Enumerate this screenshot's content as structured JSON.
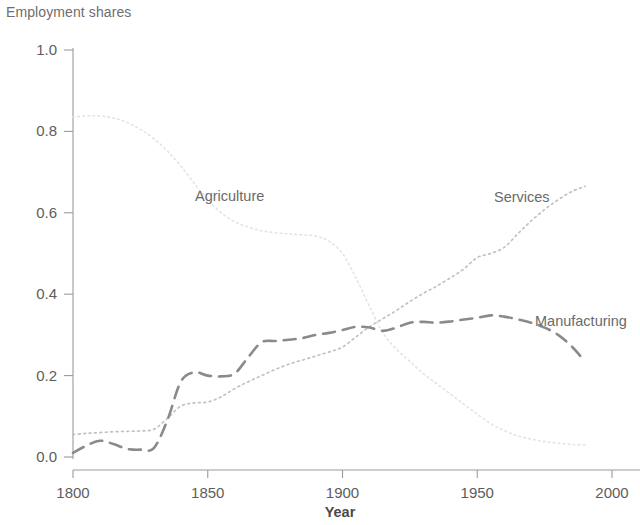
{
  "chart_title": "Employment shares",
  "axes": {
    "x": {
      "title": "Year",
      "ticks": [
        1800,
        1850,
        1900,
        1950,
        2000
      ],
      "tick_labels": [
        "1800",
        "1850",
        "1900",
        "1950",
        "2000"
      ],
      "min": 1795,
      "max": 2005
    },
    "y": {
      "title": "",
      "ticks": [
        0.0,
        0.2,
        0.4,
        0.6,
        0.8,
        1.0
      ],
      "tick_labels": [
        "0.0",
        "0.2",
        "0.4",
        "0.6",
        "0.8",
        "1.0"
      ],
      "min": 0.0,
      "max": 1.0
    }
  },
  "labels": {
    "agriculture": "Agriculture",
    "services": "Services",
    "manufacturing": "Manufacturing"
  },
  "colors": {
    "agriculture": "#e3e3e3",
    "services": "#c2c2c2",
    "manufacturing": "#8a8a8a",
    "axis": "#9b9b9b",
    "text": "#5d5d5d"
  },
  "chart_data": {
    "type": "line",
    "title": "Employment shares",
    "xlabel": "Year",
    "ylabel": "Employment shares",
    "xlim": [
      1795,
      2005
    ],
    "ylim": [
      0.0,
      1.0
    ],
    "grid": false,
    "legend_position": "inline-labels",
    "x_ticks": [
      1800,
      1850,
      1900,
      1950,
      2000
    ],
    "y_ticks": [
      0.0,
      0.2,
      0.4,
      0.6,
      0.8,
      1.0
    ],
    "series": [
      {
        "name": "Agriculture",
        "line_style": "dotted-fine",
        "color": "#e3e3e3",
        "x": [
          1800,
          1805,
          1810,
          1815,
          1820,
          1825,
          1830,
          1835,
          1840,
          1845,
          1850,
          1855,
          1860,
          1865,
          1870,
          1875,
          1880,
          1885,
          1890,
          1895,
          1900,
          1905,
          1910,
          1915,
          1920,
          1925,
          1930,
          1935,
          1940,
          1945,
          1950,
          1955,
          1960,
          1965,
          1970,
          1975,
          1980,
          1985,
          1990
        ],
        "y": [
          0.835,
          0.838,
          0.838,
          0.833,
          0.822,
          0.805,
          0.782,
          0.752,
          0.715,
          0.672,
          0.632,
          0.6,
          0.578,
          0.565,
          0.556,
          0.551,
          0.548,
          0.546,
          0.543,
          0.53,
          0.5,
          0.44,
          0.37,
          0.305,
          0.265,
          0.235,
          0.205,
          0.18,
          0.155,
          0.13,
          0.105,
          0.082,
          0.065,
          0.052,
          0.044,
          0.038,
          0.034,
          0.031,
          0.03
        ]
      },
      {
        "name": "Services",
        "line_style": "dotted",
        "color": "#c2c2c2",
        "x": [
          1800,
          1805,
          1810,
          1815,
          1820,
          1825,
          1830,
          1835,
          1840,
          1845,
          1850,
          1855,
          1860,
          1865,
          1870,
          1875,
          1880,
          1885,
          1890,
          1895,
          1900,
          1905,
          1910,
          1915,
          1920,
          1925,
          1930,
          1935,
          1940,
          1945,
          1950,
          1955,
          1960,
          1965,
          1970,
          1975,
          1980,
          1985,
          1990
        ],
        "y": [
          0.055,
          0.058,
          0.06,
          0.062,
          0.063,
          0.064,
          0.068,
          0.095,
          0.125,
          0.133,
          0.135,
          0.148,
          0.168,
          0.185,
          0.2,
          0.215,
          0.228,
          0.238,
          0.248,
          0.258,
          0.27,
          0.295,
          0.32,
          0.34,
          0.36,
          0.382,
          0.402,
          0.42,
          0.44,
          0.462,
          0.49,
          0.5,
          0.515,
          0.548,
          0.58,
          0.608,
          0.632,
          0.652,
          0.665
        ]
      },
      {
        "name": "Manufacturing",
        "line_style": "dashed",
        "color": "#8a8a8a",
        "x": [
          1800,
          1805,
          1810,
          1815,
          1820,
          1825,
          1830,
          1835,
          1840,
          1845,
          1850,
          1855,
          1860,
          1865,
          1870,
          1875,
          1880,
          1885,
          1890,
          1895,
          1900,
          1905,
          1910,
          1915,
          1920,
          1925,
          1930,
          1935,
          1940,
          1945,
          1950,
          1955,
          1960,
          1965,
          1970,
          1975,
          1980,
          1985,
          1990
        ],
        "y": [
          0.01,
          0.028,
          0.04,
          0.032,
          0.02,
          0.018,
          0.022,
          0.09,
          0.185,
          0.208,
          0.2,
          0.198,
          0.205,
          0.245,
          0.282,
          0.285,
          0.288,
          0.292,
          0.3,
          0.305,
          0.312,
          0.32,
          0.318,
          0.31,
          0.318,
          0.33,
          0.332,
          0.33,
          0.333,
          0.338,
          0.342,
          0.348,
          0.345,
          0.338,
          0.33,
          0.318,
          0.3,
          0.272,
          0.235
        ]
      }
    ]
  }
}
